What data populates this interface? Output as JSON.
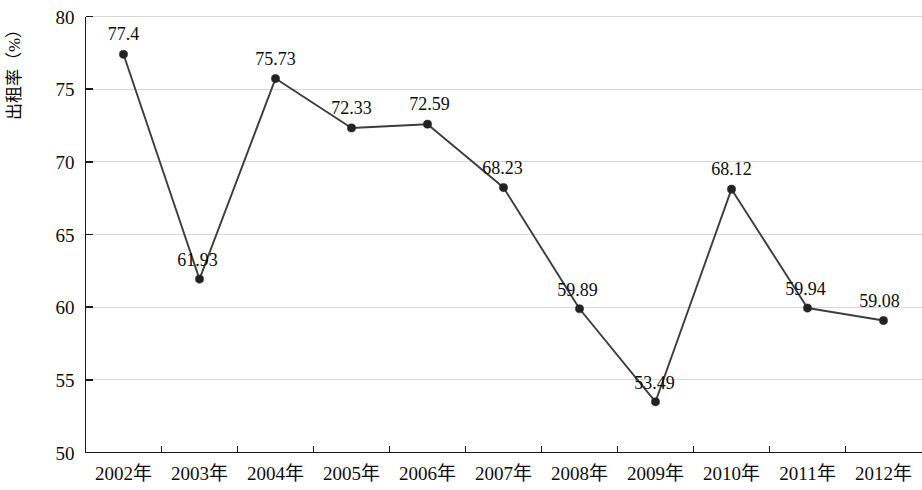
{
  "chart_data": {
    "type": "line",
    "title": "",
    "subtitle": "",
    "xlabel": "",
    "ylabel": "出租率（%）",
    "categories": [
      "2002年",
      "2003年",
      "2004年",
      "2005年",
      "2006年",
      "2007年",
      "2008年",
      "2009年",
      "2010年",
      "2011年",
      "2012年"
    ],
    "values": [
      77.4,
      61.93,
      75.73,
      72.33,
      72.59,
      68.23,
      59.89,
      53.49,
      68.12,
      59.94,
      59.08
    ],
    "data_labels": [
      "77.4",
      "61.93",
      "75.73",
      "72.33",
      "72.59",
      "68.23",
      "59.89",
      "53.49",
      "68.12",
      "59.94",
      "59.08"
    ],
    "ylim": [
      50,
      80
    ],
    "yticks": [
      50,
      55,
      60,
      65,
      70,
      75,
      80
    ],
    "ytick_labels": [
      "50",
      "55",
      "60",
      "65",
      "70",
      "75",
      "80"
    ],
    "grid": true,
    "grid_axis": "y",
    "legend": null,
    "legend_position": "none",
    "series": [
      {
        "name": "出租率",
        "values": [
          77.4,
          61.93,
          75.73,
          72.33,
          72.59,
          68.23,
          59.89,
          53.49,
          68.12,
          59.94,
          59.08
        ]
      }
    ]
  },
  "style": {
    "line_color": "#3d3d3d",
    "marker_color": "#222222",
    "grid_color": "#d8d8d8",
    "axis_color": "#1a1a1a",
    "text_color": "#0d0d0d",
    "background": "#ffffff"
  },
  "label_offsets": [
    {
      "dx": 0,
      "dy": -14,
      "anchor": "middle"
    },
    {
      "dx": -2,
      "dy": -13,
      "anchor": "middle"
    },
    {
      "dx": 0,
      "dy": -14,
      "anchor": "middle"
    },
    {
      "dx": 0,
      "dy": -14,
      "anchor": "middle"
    },
    {
      "dx": 2,
      "dy": -14,
      "anchor": "middle"
    },
    {
      "dx": -1,
      "dy": -14,
      "anchor": "middle"
    },
    {
      "dx": -2,
      "dy": -13,
      "anchor": "middle"
    },
    {
      "dx": -1,
      "dy": -13,
      "anchor": "middle"
    },
    {
      "dx": 0,
      "dy": -14,
      "anchor": "middle"
    },
    {
      "dx": -2,
      "dy": -13,
      "anchor": "middle"
    },
    {
      "dx": -4,
      "dy": -14,
      "anchor": "middle"
    }
  ]
}
